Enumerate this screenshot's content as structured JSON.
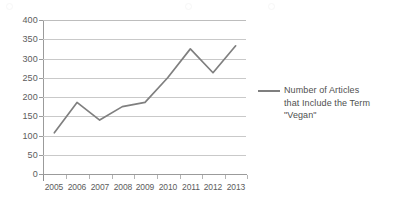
{
  "chart_data": {
    "type": "line",
    "title": "",
    "xlabel": "",
    "ylabel": "",
    "categories": [
      "2005",
      "2006",
      "2007",
      "2008",
      "2009",
      "2010",
      "2011",
      "2012",
      "2013"
    ],
    "series": [
      {
        "name": "Number of Articles that Include the Term \"Vegan\"",
        "values": [
          107,
          186,
          140,
          175,
          186,
          250,
          325,
          263,
          333
        ],
        "color": "#7f7f7f"
      }
    ],
    "ylim": [
      0,
      400
    ],
    "y_ticks": [
      "0",
      "50",
      "100",
      "150",
      "200",
      "250",
      "300",
      "350",
      "400"
    ],
    "y_tick_values": [
      0,
      50,
      100,
      150,
      200,
      250,
      300,
      350,
      400
    ],
    "grid": "horizontal",
    "legend_position": "right",
    "markers": false
  },
  "legend": {
    "entries": [
      {
        "label": "Number of Articles\nthat Include the Term\n\"Vegan\"",
        "color": "#7f7f7f",
        "swatch": "line-swatch-icon"
      }
    ]
  },
  "colors": {
    "series_line": "#7f7f7f",
    "gridline": "#c9c9c9",
    "axis": "#9b9b9b",
    "tick_label": "#5c5c5c",
    "legend_text": "#4f4f4f",
    "background": "#ffffff"
  }
}
